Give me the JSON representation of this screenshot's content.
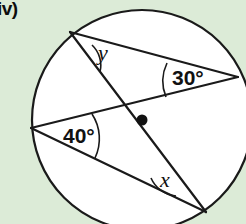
{
  "label": {
    "part": "iv)"
  },
  "figure": {
    "name": "circle-with-two-intersecting-chord-pairs",
    "background_color": "#dcebd7",
    "interior_color": "#ffffff",
    "stroke_color": "#1a1a1a",
    "circle": {
      "cx": 142,
      "cy": 120,
      "r": 110
    },
    "center_dot": {
      "cx": 142,
      "cy": 120,
      "r": 5.5
    },
    "points": {
      "A": {
        "x": 70,
        "y": 32,
        "name": "top-left-point"
      },
      "B": {
        "x": 238,
        "y": 77,
        "name": "right-point"
      },
      "C": {
        "x": 31,
        "y": 128,
        "name": "left-point"
      },
      "D": {
        "x": 206,
        "y": 212,
        "name": "bottom-right-point"
      }
    },
    "chords": [
      {
        "name": "chord-A-B",
        "from": "A",
        "to": "B"
      },
      {
        "name": "chord-A-D",
        "from": "A",
        "to": "D"
      },
      {
        "name": "chord-C-B",
        "from": "C",
        "to": "B"
      },
      {
        "name": "chord-C-D",
        "from": "C",
        "to": "D"
      }
    ],
    "angles": [
      {
        "id": "angle-y",
        "label": "y",
        "label_x": 98,
        "label_y": 60,
        "vertex": "A",
        "arc": "M 92 45 A 28 28 0 0 1 100 72",
        "style": "variable"
      },
      {
        "id": "angle-30",
        "label": "30°",
        "label_x": 172,
        "label_y": 85,
        "vertex": "B",
        "arc": "M 167 63 A 42 42 0 0 0 166 97",
        "style": "measure"
      },
      {
        "id": "angle-40",
        "label": "40°",
        "label_x": 63,
        "label_y": 143,
        "vertex": "C",
        "arc": "M 92 114 A 45 45 0 0 1 95 158",
        "style": "measure"
      },
      {
        "id": "angle-x",
        "label": "x",
        "label_x": 160,
        "label_y": 187,
        "vertex": "D",
        "arc": "M 151 178 A 30 30 0 0 0 176 196",
        "style": "variable"
      }
    ]
  }
}
